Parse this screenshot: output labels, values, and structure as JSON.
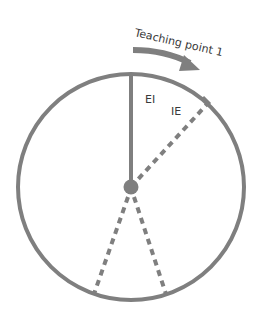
{
  "diagram": {
    "title": "Teaching point 1",
    "colors": {
      "stroke": "#7f7f7f",
      "text": "#3a3a3a",
      "background": "#ffffff"
    },
    "circle": {
      "cx": 131,
      "cy": 187,
      "r": 113
    },
    "center_dot": {
      "cx": 131,
      "cy": 187,
      "r": 7
    },
    "arrow": {
      "label": "Teaching point 1",
      "direction": "clockwise"
    },
    "labels": {
      "ei": "EI",
      "ie": "IE"
    },
    "lines": [
      {
        "name": "EI",
        "style": "solid",
        "to": [
          131,
          74
        ]
      },
      {
        "name": "IE",
        "style": "dashed",
        "to": [
          209,
          102
        ]
      },
      {
        "name": "bottom-left",
        "style": "dashed",
        "to": [
          94,
          294
        ]
      },
      {
        "name": "bottom-right",
        "style": "dashed",
        "to": [
          166,
          294
        ]
      }
    ]
  }
}
